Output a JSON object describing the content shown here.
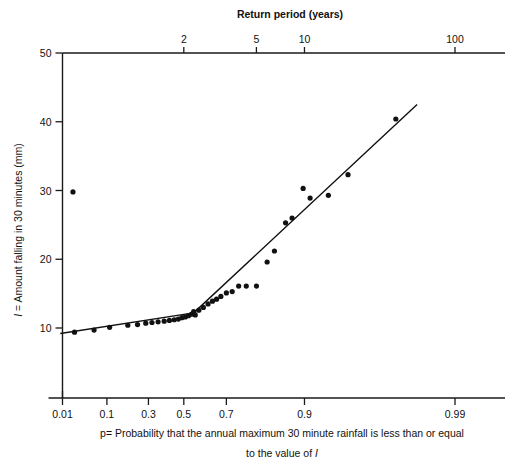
{
  "chart_data": {
    "type": "scatter",
    "title": "",
    "top_axis": {
      "label": "Return period (years)",
      "ticks": [
        {
          "text": "2",
          "p": 0.5
        },
        {
          "text": "5",
          "p": 0.8
        },
        {
          "text": "10",
          "p": 0.9
        },
        {
          "text": "100",
          "p": 0.99
        }
      ]
    },
    "xlabel_line1": "p= Probability that the annual  maximum 30 minute rainfall is less than or equal",
    "xlabel_line2_pre": "to the value of ",
    "xlabel_line2_italic": "I",
    "x_ticks": [
      "0.01",
      "0.1",
      "0.3",
      "0.5",
      "0.7",
      "0.9",
      "0.99"
    ],
    "x_tick_values": [
      0.01,
      0.1,
      0.3,
      0.5,
      0.7,
      0.9,
      0.99
    ],
    "ylabel_pre": "I",
    "ylabel_rest": " = Amount falling in 30 minutes (mm)",
    "ylabel_full": "I = Amount falling in 30 minutes (mm)",
    "y_ticks": [
      "10",
      "20",
      "30",
      "40",
      "50"
    ],
    "y_tick_values": [
      10,
      20,
      30,
      40,
      50
    ],
    "ylim": [
      2.5,
      50
    ],
    "xlim_prob": [
      0.004,
      0.996
    ],
    "grid": false,
    "legend": "none",
    "scale_note": "x axis is a Gumbel reduced-variate (probability) scale; top axis shows return period T = 1/(1-p)",
    "points": [
      {
        "p": 0.02,
        "I": 29.8
      },
      {
        "p": 0.022,
        "I": 9.4
      },
      {
        "p": 0.06,
        "I": 9.7
      },
      {
        "p": 0.11,
        "I": 10.1
      },
      {
        "p": 0.19,
        "I": 10.4
      },
      {
        "p": 0.24,
        "I": 10.5
      },
      {
        "p": 0.285,
        "I": 10.7
      },
      {
        "p": 0.32,
        "I": 10.8
      },
      {
        "p": 0.355,
        "I": 10.9
      },
      {
        "p": 0.39,
        "I": 11.0
      },
      {
        "p": 0.42,
        "I": 11.1
      },
      {
        "p": 0.447,
        "I": 11.2
      },
      {
        "p": 0.47,
        "I": 11.3
      },
      {
        "p": 0.49,
        "I": 11.5
      },
      {
        "p": 0.508,
        "I": 11.6
      },
      {
        "p": 0.525,
        "I": 11.8
      },
      {
        "p": 0.54,
        "I": 12.0
      },
      {
        "p": 0.552,
        "I": 12.4
      },
      {
        "p": 0.56,
        "I": 11.9
      },
      {
        "p": 0.578,
        "I": 12.6
      },
      {
        "p": 0.6,
        "I": 13.0
      },
      {
        "p": 0.622,
        "I": 13.5
      },
      {
        "p": 0.642,
        "I": 13.9
      },
      {
        "p": 0.66,
        "I": 14.2
      },
      {
        "p": 0.678,
        "I": 14.6
      },
      {
        "p": 0.7,
        "I": 15.1
      },
      {
        "p": 0.722,
        "I": 15.3
      },
      {
        "p": 0.745,
        "I": 16.1
      },
      {
        "p": 0.77,
        "I": 16.1
      },
      {
        "p": 0.8,
        "I": 16.1
      },
      {
        "p": 0.828,
        "I": 19.6
      },
      {
        "p": 0.845,
        "I": 21.2
      },
      {
        "p": 0.868,
        "I": 25.3
      },
      {
        "p": 0.88,
        "I": 26.0
      },
      {
        "p": 0.898,
        "I": 30.3
      },
      {
        "p": 0.908,
        "I": 28.9
      },
      {
        "p": 0.93,
        "I": 29.3
      },
      {
        "p": 0.948,
        "I": 32.3
      },
      {
        "p": 0.975,
        "I": 40.4
      }
    ],
    "fit_line": {
      "description": "two-segment fitted line with a break near p=0.55",
      "vertices": [
        {
          "p": 0.0085,
          "I": 9.2
        },
        {
          "p": 0.552,
          "I": 12.2
        },
        {
          "p": 0.982,
          "I": 42.5
        }
      ]
    }
  },
  "figure": {
    "background": "#ffffff",
    "ink_color": "#111111"
  }
}
